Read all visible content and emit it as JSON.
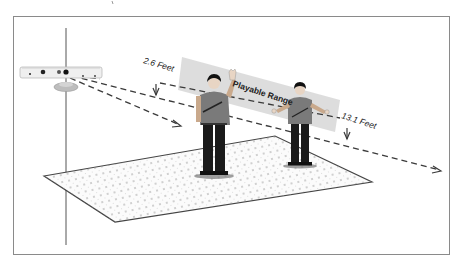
{
  "diagram": {
    "labels": {
      "near_distance": "2.6 Feet",
      "far_distance": "13.1 Feet",
      "range_band": "Playable Range"
    },
    "colors": {
      "frame": "#8a8a8a",
      "band": "#d9d9d9",
      "floor_fill": "#fbfbfb",
      "floor_dots": "#9a9a9a",
      "dash": "#444444",
      "shirt": "#7a7a7a",
      "pants": "#1a1a1a",
      "sensor_body": "#eeeeee",
      "sensor_base": "#bdbdbd"
    },
    "people_count": 2
  }
}
